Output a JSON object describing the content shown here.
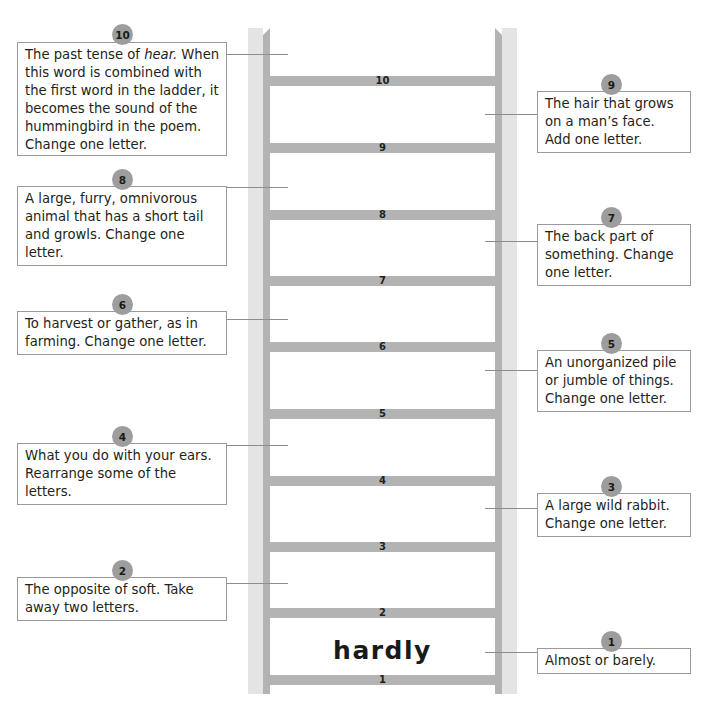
{
  "ladder": {
    "start_word": "hardly",
    "rungs": [
      {
        "number": "1",
        "top": 675
      },
      {
        "number": "2",
        "top": 608
      },
      {
        "number": "3",
        "top": 542
      },
      {
        "number": "4",
        "top": 476
      },
      {
        "number": "5",
        "top": 409
      },
      {
        "number": "6",
        "top": 342
      },
      {
        "number": "7",
        "top": 276
      },
      {
        "number": "8",
        "top": 210
      },
      {
        "number": "9",
        "top": 143
      },
      {
        "number": "10",
        "top": 76
      }
    ],
    "colors": {
      "rail_light": "#e4e4e4",
      "rail_dark": "#b3b3b3",
      "badge": "#9d9d9d",
      "border": "#9a9a9a"
    }
  },
  "clues": {
    "c10": {
      "badge": "10",
      "pre": "The past tense of ",
      "em": "hear.",
      "post": "  When this word is combined with the first word in the ladder, it becomes the sound of the hummingbird in the poem. Change one letter."
    },
    "c9": {
      "badge": "9",
      "text": "The hair that grows on a man’s face. Add one letter."
    },
    "c8": {
      "badge": "8",
      "text": "A large, furry, omnivorous animal that has a short tail and growls.  Change one letter."
    },
    "c7": {
      "badge": "7",
      "text": "The back part of something.  Change one letter."
    },
    "c6": {
      "badge": "6",
      "text": "To harvest or gather, as in farming.  Change one letter."
    },
    "c5": {
      "badge": "5",
      "text": "An unorganized pile or jumble of things. Change one letter."
    },
    "c4": {
      "badge": "4",
      "text": "What you do with your ears.  Rearrange some of the letters."
    },
    "c3": {
      "badge": "3",
      "text": "A large wild rabbit. Change one letter."
    },
    "c2": {
      "badge": "2",
      "text": "The opposite of soft.  Take away two letters."
    },
    "c1": {
      "badge": "1",
      "text": "Almost or barely."
    }
  }
}
